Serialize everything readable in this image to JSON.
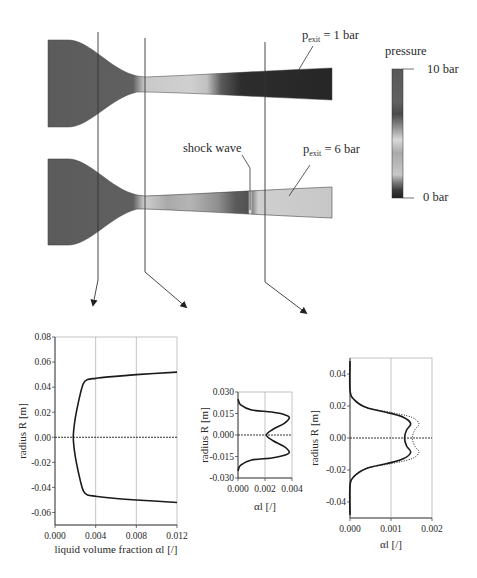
{
  "figure": {
    "top_panel": {
      "colorbar": {
        "title": "pressure",
        "max_label": "10 bar",
        "min_label": "0 bar",
        "stops": [
          "#1e1e1e",
          "#3a3a3a",
          "#7a7a7a",
          "#c8c8c8",
          "#a9a9a9",
          "#d9d9d9",
          "#8e8e8e",
          "#4a4a4a",
          "#616161",
          "#595959"
        ]
      },
      "nozzle_1": {
        "label_p": "p",
        "label_sub": "exit",
        "label_rest": " = 1  bar"
      },
      "nozzle_2": {
        "label_p": "p",
        "label_sub": "exit",
        "label_rest": " = 6  bar",
        "shock_label": "shock wave"
      }
    }
  },
  "chart_data": [
    {
      "type": "line",
      "title": "",
      "xlabel": "liquid volume fraction αl [/]",
      "ylabel": "radius R [m]",
      "xlim": [
        0.0,
        0.012
      ],
      "ylim": [
        -0.07,
        0.08
      ],
      "xticks": [
        "0.000",
        "0.004",
        "0.008",
        "0.012"
      ],
      "yticks": [
        "0.08",
        "0.06",
        "0.04",
        "0.02",
        "0.00",
        "-0.02",
        "-0.04",
        "-0.06"
      ],
      "grid": "vertical",
      "series": [
        {
          "name": "alpha_l profile (throat region)",
          "style": "solid",
          "points": [
            [
              0.012,
              0.052
            ],
            [
              0.008,
              0.05
            ],
            [
              0.005,
              0.048
            ],
            [
              0.004,
              0.047
            ],
            [
              0.0032,
              0.046
            ],
            [
              0.0028,
              0.043
            ],
            [
              0.0025,
              0.035
            ],
            [
              0.0021,
              0.02
            ],
            [
              0.0019,
              0.01
            ],
            [
              0.0018,
              0.0
            ],
            [
              0.0019,
              -0.01
            ],
            [
              0.0021,
              -0.02
            ],
            [
              0.0025,
              -0.035
            ],
            [
              0.0028,
              -0.043
            ],
            [
              0.0032,
              -0.046
            ],
            [
              0.004,
              -0.047
            ],
            [
              0.005,
              -0.048
            ],
            [
              0.008,
              -0.05
            ],
            [
              0.012,
              -0.052
            ]
          ]
        }
      ]
    },
    {
      "type": "line",
      "title": "",
      "xlabel": "αl [/]",
      "ylabel": "radius R [m]",
      "xlim": [
        0.0,
        0.004
      ],
      "ylim": [
        -0.03,
        0.03
      ],
      "xticks": [
        "0.000",
        "0.002",
        "0.004"
      ],
      "yticks": [
        "0.030",
        "0.015",
        "0.000",
        "-0.015",
        "-0.030"
      ],
      "grid": "vertical",
      "series": [
        {
          "name": "alpha_l profile (mid diverging)",
          "style": "solid",
          "points": [
            [
              0.0,
              0.025
            ],
            [
              0.0002,
              0.021
            ],
            [
              0.001,
              0.0175
            ],
            [
              0.0025,
              0.016
            ],
            [
              0.0035,
              0.014
            ],
            [
              0.0038,
              0.012
            ],
            [
              0.0034,
              0.008
            ],
            [
              0.0026,
              0.004
            ],
            [
              0.0021,
              0.0
            ],
            [
              0.0026,
              -0.004
            ],
            [
              0.0034,
              -0.008
            ],
            [
              0.0038,
              -0.012
            ],
            [
              0.0035,
              -0.014
            ],
            [
              0.0025,
              -0.016
            ],
            [
              0.001,
              -0.0175
            ],
            [
              0.0002,
              -0.021
            ],
            [
              0.0,
              -0.025
            ]
          ]
        }
      ]
    },
    {
      "type": "line",
      "title": "",
      "xlabel": "αl [/]",
      "ylabel": "radius R [m]",
      "xlim": [
        0.0,
        0.002
      ],
      "ylim": [
        -0.05,
        0.05
      ],
      "xticks": [
        "0.000",
        "0.001",
        "0.002"
      ],
      "yticks": [
        "0.04",
        "0.02",
        "0.00",
        "-0.02",
        "-0.04"
      ],
      "grid": "vertical",
      "series": [
        {
          "name": "p_exit = 1 bar",
          "style": "solid",
          "points": [
            [
              0.0,
              0.048
            ],
            [
              0.0,
              0.03
            ],
            [
              0.0001,
              0.024
            ],
            [
              0.0004,
              0.019
            ],
            [
              0.0009,
              0.016
            ],
            [
              0.0013,
              0.013
            ],
            [
              0.00148,
              0.009
            ],
            [
              0.00138,
              0.005
            ],
            [
              0.00133,
              0.0
            ],
            [
              0.00138,
              -0.005
            ],
            [
              0.00148,
              -0.009
            ],
            [
              0.0013,
              -0.013
            ],
            [
              0.0009,
              -0.016
            ],
            [
              0.0004,
              -0.019
            ],
            [
              0.0001,
              -0.024
            ],
            [
              0.0,
              -0.03
            ],
            [
              0.0,
              -0.048
            ]
          ]
        },
        {
          "name": "p_exit = 6 bar",
          "style": "dotted",
          "points": [
            [
              0.0,
              0.048
            ],
            [
              0.0,
              0.03
            ],
            [
              0.0001,
              0.024
            ],
            [
              0.0004,
              0.019
            ],
            [
              0.001,
              0.016
            ],
            [
              0.0015,
              0.013
            ],
            [
              0.00168,
              0.009
            ],
            [
              0.00158,
              0.005
            ],
            [
              0.00152,
              0.0
            ],
            [
              0.00158,
              -0.005
            ],
            [
              0.00168,
              -0.009
            ],
            [
              0.0015,
              -0.013
            ],
            [
              0.001,
              -0.016
            ],
            [
              0.0004,
              -0.019
            ],
            [
              0.0001,
              -0.024
            ],
            [
              0.0,
              -0.03
            ],
            [
              0.0,
              -0.048
            ]
          ]
        }
      ]
    }
  ]
}
